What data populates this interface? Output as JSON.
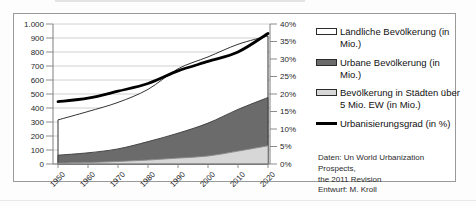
{
  "chart_data": {
    "type": "area",
    "title": "",
    "x": [
      1950,
      1960,
      1970,
      1980,
      1990,
      2000,
      2010,
      2020
    ],
    "x_tick_labels": [
      "1950",
      "1960",
      "1970",
      "1980",
      "1990",
      "2000",
      "2010",
      "2020"
    ],
    "left_axis": {
      "min": 0,
      "max": 1000,
      "step": 100,
      "tick_labels_top_to_bottom": [
        "1.000",
        "900",
        "800",
        "700",
        "600",
        "500",
        "400",
        "300",
        "200",
        "100",
        "0"
      ]
    },
    "right_axis": {
      "min": 0,
      "max": 40,
      "step": 5,
      "unit": "%",
      "tick_labels_top_to_bottom": [
        "40%",
        "35%",
        "30%",
        "25%",
        "20%",
        "15%",
        "10%",
        "5%",
        "0%"
      ]
    },
    "grid": "horizontal",
    "legend_position": "right",
    "series": [
      {
        "key": "rural",
        "name": "Ländliche Bevölkerung (in Mio.)",
        "type": "area",
        "axis": "left",
        "fill": "#ffffff",
        "stroke": "#1c1c1c",
        "values": [
          315,
          375,
          440,
          533,
          680,
          765,
          855,
          915
        ]
      },
      {
        "key": "urban",
        "name": "Urbane Bevölkerung (in Mio.)",
        "type": "area",
        "axis": "left",
        "fill": "#6b6b6b",
        "stroke": "#3a3a3a",
        "values": [
          63,
          80,
          108,
          160,
          220,
          292,
          390,
          475
        ]
      },
      {
        "key": "megacities",
        "name": "Bevölkerung in Städten über 5 Mio. EW (in Mio.)",
        "type": "area",
        "axis": "left",
        "fill": "#d7d7d7",
        "stroke": "#8a8a8a",
        "values": [
          6,
          10,
          18,
          28,
          42,
          57,
          92,
          130
        ]
      },
      {
        "key": "urbanization-degree",
        "name": "Urbanisierungsgrad (in %)",
        "type": "line",
        "axis": "right",
        "stroke": "#000000",
        "values": [
          17.8,
          18.8,
          20.8,
          23.0,
          26.6,
          29.3,
          32.0,
          37.3
        ]
      }
    ]
  },
  "source": {
    "line1": "Daten: Un World Urbanization Prospects,",
    "line2": "the 2011 Revision",
    "line3": "Entwurf: M. Kroll"
  },
  "colors": {
    "gridline": "#c4c4c4",
    "axis": "#7f7f7f",
    "frame_border": "#9a9a9a",
    "text": "#1f1f1f"
  }
}
